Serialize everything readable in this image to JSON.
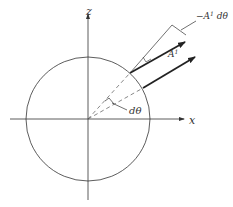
{
  "diagram": {
    "axes": {
      "x_label": "x",
      "z_label": "z"
    },
    "labels": {
      "vector": "A",
      "vector_superscript": "1",
      "change": "−A",
      "change_superscript": "1",
      "change_suffix": " dθ",
      "angle": "dθ"
    },
    "colors": {
      "stroke": "#333333",
      "arrow": "#222222",
      "dashed": "#555555"
    }
  }
}
